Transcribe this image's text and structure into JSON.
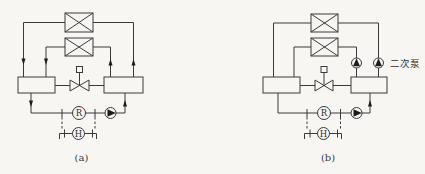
{
  "colors": {
    "line": "#3a3a3a",
    "background": "#f7f6f3",
    "arrow_fill": "#1d1d1d"
  },
  "diagram_a": {
    "caption": "(a)",
    "regulator_label": "R",
    "sensor_label": "H"
  },
  "diagram_b": {
    "caption": "(b)",
    "regulator_label": "R",
    "sensor_label": "H",
    "secondary_pump_label": "二次泵"
  }
}
